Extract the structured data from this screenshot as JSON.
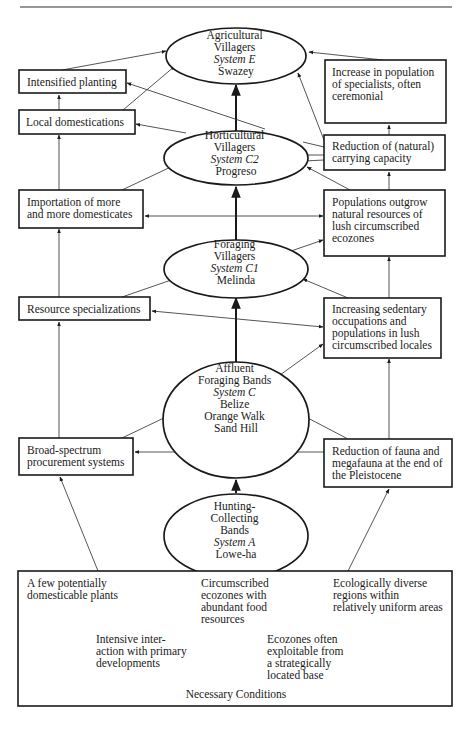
{
  "diagram": {
    "ellipses": [
      {
        "id": "agricultural",
        "lines": [
          {
            "t": "Agricultural"
          },
          {
            "t": "Villagers"
          },
          {
            "t": "System E",
            "italic": true
          },
          {
            "t": "Swazey"
          }
        ]
      },
      {
        "id": "horticultural",
        "lines": [
          {
            "t": "Horticultural"
          },
          {
            "t": "Villagers"
          },
          {
            "t": "System C2",
            "italic": true
          },
          {
            "t": "Progreso"
          }
        ]
      },
      {
        "id": "foraging-villagers",
        "lines": [
          {
            "t": "Foraging"
          },
          {
            "t": "Villagers"
          },
          {
            "t": "System C1",
            "italic": true
          },
          {
            "t": "Melinda"
          }
        ]
      },
      {
        "id": "affluent-foraging",
        "lines": [
          {
            "t": "Affluent"
          },
          {
            "t": "Foraging Bands"
          },
          {
            "t": "System C",
            "italic": true
          },
          {
            "t": "Belize"
          },
          {
            "t": "Orange Walk"
          },
          {
            "t": "Sand Hill"
          }
        ]
      },
      {
        "id": "hunting-collecting",
        "lines": [
          {
            "t": "Hunting-"
          },
          {
            "t": "Collecting"
          },
          {
            "t": "Bands"
          },
          {
            "t": "System A",
            "italic": true
          },
          {
            "t": "Lowe-ha"
          }
        ]
      }
    ],
    "boxes": [
      {
        "id": "intensified-planting",
        "lines": [
          "Intensified planting"
        ]
      },
      {
        "id": "increase-specialists",
        "lines": [
          "Increase in population",
          "of specialists, often",
          "ceremonial"
        ]
      },
      {
        "id": "local-domestications",
        "lines": [
          "Local domestications"
        ]
      },
      {
        "id": "reduction-carrying",
        "lines": [
          "Reduction of (natural)",
          "carrying capacity"
        ]
      },
      {
        "id": "importation",
        "lines": [
          "Importation of more",
          "and more domesticates"
        ]
      },
      {
        "id": "populations-outgrow",
        "lines": [
          "Populations outgrow",
          "natural resources of",
          "lush circumscribed",
          "ecozones"
        ]
      },
      {
        "id": "resource-specializations",
        "lines": [
          "Resource specializations"
        ]
      },
      {
        "id": "increasing-sedentary",
        "lines": [
          "Increasing sedentary",
          "occupations and",
          "populations in lush",
          "circumscribed locales"
        ]
      },
      {
        "id": "broad-spectrum",
        "lines": [
          "Broad-spectrum",
          "procurement systems"
        ]
      },
      {
        "id": "reduction-fauna",
        "lines": [
          "Reduction of fauna and",
          "megafauna at the end of",
          "the Pleistocene"
        ]
      }
    ],
    "necessary_conditions": {
      "title": "Necessary Conditions",
      "items": [
        {
          "id": "few-plants",
          "lines": [
            "A few potentially",
            "domesticable plants"
          ]
        },
        {
          "id": "circumscribed-ecozones",
          "lines": [
            "Circumscribed",
            "ecozones with",
            "abundant food",
            "resources"
          ]
        },
        {
          "id": "ecologically-diverse",
          "lines": [
            "Ecologically diverse",
            "regions within",
            "relatively uniform areas"
          ]
        },
        {
          "id": "intensive-interaction",
          "lines": [
            "Intensive inter-",
            "action with primary",
            "developments"
          ]
        },
        {
          "id": "ecozones-exploitable",
          "lines": [
            "Ecozones often",
            "exploitable from",
            "a strategically",
            "located base"
          ]
        }
      ]
    }
  }
}
